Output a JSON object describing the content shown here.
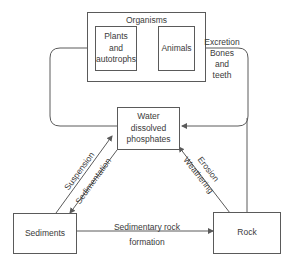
{
  "diagram": {
    "type": "phosphorus-cycle",
    "nodes": {
      "organisms": {
        "label": "Organisms"
      },
      "plants": {
        "label_lines": [
          "Plants",
          "and",
          "autotrophs"
        ]
      },
      "animals": {
        "label": "Animals"
      },
      "water": {
        "label_lines": [
          "Water",
          "dissolved",
          "phosphates"
        ]
      },
      "sediments": {
        "label": "Sediments"
      },
      "rock": {
        "label": "Rock"
      }
    },
    "edges": {
      "excretion": {
        "label_lines": [
          "Excretion",
          "Bones",
          "and",
          "teeth"
        ]
      },
      "suspension": {
        "label": "Suspension"
      },
      "sedimentation": {
        "label": "Sedimentation"
      },
      "erosion": {
        "label": "Erosion"
      },
      "weathering": {
        "label": "Weathering"
      },
      "sedimentary_rock": {
        "label_lines": [
          "Sedimentary rock",
          "formation"
        ]
      }
    },
    "colors": {
      "line": "#5a5a5a",
      "text": "#3a3a3a",
      "background": "#ffffff"
    }
  }
}
